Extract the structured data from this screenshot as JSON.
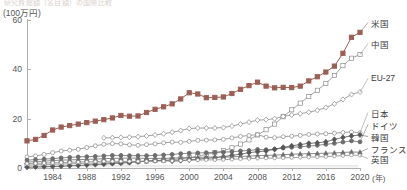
{
  "header": {
    "clipped_title": "研究費総額（名目額）の国際比較",
    "unit_label": "(100万円)"
  },
  "axes": {
    "y_ticks": [
      0,
      20,
      40,
      60
    ],
    "x_ticks": [
      1984,
      1988,
      1992,
      1996,
      2000,
      2004,
      2008,
      2012,
      2016,
      2020
    ],
    "x_unit": "(年)"
  },
  "colors": {
    "accent_us": "#9c5f55",
    "gray_line": "#8a8a8a",
    "dark_line": "#555555",
    "axis": "#b0b0b0",
    "text": "#4a4a4a"
  },
  "legend": [
    {
      "key": "us",
      "label": "米国",
      "y": 22
    },
    {
      "key": "china",
      "label": "中国",
      "y": 43
    },
    {
      "key": "eu27",
      "label": "EU-27",
      "y": 78
    },
    {
      "key": "japan",
      "label": "日本",
      "y": 112
    },
    {
      "key": "germany",
      "label": "ドイツ",
      "y": 124
    },
    {
      "key": "korea",
      "label": "韓国",
      "y": 136
    },
    {
      "key": "france",
      "label": "フランス",
      "y": 148
    },
    {
      "key": "uk",
      "label": "英国",
      "y": 158
    }
  ],
  "chart_data": {
    "type": "line",
    "title": "研究費総額（名目額）の国際比較",
    "xlabel": "年",
    "ylabel": "(100万円)",
    "ylim": [
      0,
      60
    ],
    "xlim": [
      1981,
      2020
    ],
    "grid": false,
    "legend_position": "right",
    "x": [
      1981,
      1982,
      1983,
      1984,
      1985,
      1986,
      1987,
      1988,
      1989,
      1990,
      1991,
      1992,
      1993,
      1994,
      1995,
      1996,
      1997,
      1998,
      1999,
      2000,
      2001,
      2002,
      2003,
      2004,
      2005,
      2006,
      2007,
      2008,
      2009,
      2010,
      2011,
      2012,
      2013,
      2014,
      2015,
      2016,
      2017,
      2018,
      2019,
      2020
    ],
    "series": [
      {
        "name": "米国",
        "marker": "filled-square",
        "color": "#9c5f55",
        "values": [
          11.0,
          11.6,
          13.2,
          15.4,
          16.6,
          17.2,
          17.8,
          18.4,
          19.0,
          19.6,
          20.3,
          21.3,
          21.0,
          21.1,
          22.5,
          23.8,
          24.8,
          26.0,
          28.0,
          30.5,
          30.0,
          28.5,
          28.6,
          28.8,
          30.2,
          31.9,
          33.4,
          34.8,
          33.2,
          32.5,
          32.7,
          32.6,
          33.2,
          35.3,
          37.0,
          38.9,
          41.3,
          46.5,
          53.0,
          55.0
        ]
      },
      {
        "name": "中国",
        "marker": "open-square",
        "color": "#8a8a8a",
        "values": [
          1.2,
          1.3,
          1.4,
          1.5,
          1.6,
          1.7,
          1.8,
          1.9,
          2.0,
          2.1,
          2.2,
          2.3,
          2.5,
          2.6,
          2.8,
          3.0,
          3.2,
          3.4,
          3.7,
          4.2,
          4.8,
          5.5,
          6.2,
          7.0,
          8.2,
          9.7,
          11.4,
          13.4,
          15.5,
          17.8,
          20.8,
          23.6,
          26.3,
          29.0,
          31.5,
          34.3,
          37.5,
          41.5,
          44.5,
          46.0
        ]
      },
      {
        "name": "EU-27",
        "marker": "open-diamond",
        "color": "#8a8a8a",
        "values": [
          null,
          null,
          null,
          null,
          null,
          null,
          null,
          null,
          null,
          12.2,
          12.3,
          12.4,
          12.5,
          12.7,
          13.0,
          13.4,
          13.9,
          14.5,
          15.2,
          16.0,
          16.2,
          16.2,
          16.2,
          16.4,
          17.0,
          17.8,
          18.6,
          19.4,
          19.6,
          20.0,
          20.9,
          21.5,
          22.0,
          22.6,
          23.4,
          24.5,
          26.0,
          27.8,
          29.8,
          30.8
        ]
      },
      {
        "name": "日本",
        "marker": "open-circle",
        "color": "#8a8a8a",
        "values": [
          4.5,
          4.9,
          5.5,
          6.2,
          6.9,
          7.2,
          7.6,
          8.3,
          9.0,
          9.6,
          9.9,
          9.8,
          9.4,
          9.2,
          9.5,
          9.8,
          10.2,
          10.5,
          10.4,
          10.8,
          11.2,
          11.3,
          11.4,
          11.6,
          12.2,
          12.8,
          13.2,
          13.5,
          12.5,
          12.3,
          12.7,
          12.9,
          13.2,
          13.6,
          13.8,
          13.9,
          14.1,
          14.4,
          14.6,
          14.3
        ]
      },
      {
        "name": "ドイツ",
        "marker": "filled-circle",
        "color": "#6d6d6d",
        "values": [
          3.2,
          3.4,
          3.6,
          3.8,
          4.1,
          4.3,
          4.5,
          4.6,
          4.7,
          4.9,
          5.1,
          5.1,
          5.0,
          5.0,
          5.0,
          5.1,
          5.3,
          5.5,
          5.8,
          6.0,
          6.1,
          6.2,
          6.3,
          6.4,
          6.6,
          6.9,
          7.1,
          7.5,
          7.4,
          7.6,
          8.1,
          8.4,
          8.6,
          8.9,
          9.2,
          9.6,
          10.0,
          10.5,
          11.0,
          10.6
        ]
      },
      {
        "name": "韓国",
        "marker": "filled-diamond",
        "color": "#555555",
        "values": [
          0.3,
          0.4,
          0.5,
          0.6,
          0.7,
          0.9,
          1.0,
          1.2,
          1.4,
          1.6,
          1.8,
          2.0,
          2.2,
          2.5,
          2.8,
          3.0,
          3.1,
          2.8,
          3.0,
          3.3,
          3.6,
          3.9,
          4.2,
          4.6,
          5.1,
          5.6,
          6.2,
          6.6,
          6.9,
          7.6,
          8.4,
          9.0,
          9.5,
          10.0,
          10.2,
          10.6,
          11.6,
          12.4,
          13.0,
          13.4
        ]
      },
      {
        "name": "フランス",
        "marker": "filled-triangle",
        "color": "#6d6d6d",
        "values": [
          2.4,
          2.6,
          2.8,
          3.0,
          3.2,
          3.3,
          3.4,
          3.5,
          3.6,
          3.8,
          3.9,
          4.0,
          4.0,
          4.0,
          3.9,
          3.9,
          3.9,
          4.0,
          4.1,
          4.2,
          4.3,
          4.4,
          4.4,
          4.4,
          4.5,
          4.7,
          4.8,
          5.0,
          5.1,
          5.2,
          5.4,
          5.6,
          5.7,
          5.8,
          5.9,
          6.0,
          6.1,
          6.3,
          6.5,
          6.4
        ]
      },
      {
        "name": "英国",
        "marker": "open-circle-small",
        "color": "#8a8a8a",
        "values": [
          1.8,
          1.9,
          2.0,
          2.1,
          2.2,
          2.3,
          2.4,
          2.5,
          2.6,
          2.7,
          2.7,
          2.7,
          2.7,
          2.7,
          2.7,
          2.8,
          2.8,
          2.9,
          3.0,
          3.1,
          3.2,
          3.3,
          3.3,
          3.4,
          3.5,
          3.7,
          3.8,
          3.9,
          4.0,
          4.0,
          4.1,
          4.2,
          4.3,
          4.4,
          4.5,
          4.6,
          4.8,
          5.0,
          5.2,
          5.1
        ]
      }
    ]
  }
}
